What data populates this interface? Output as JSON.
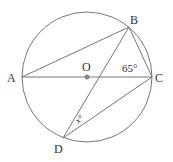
{
  "diagram": {
    "points": {
      "A": {
        "label": "A"
      },
      "B": {
        "label": "B"
      },
      "C": {
        "label": "C"
      },
      "D": {
        "label": "D"
      },
      "O": {
        "label": "O"
      }
    },
    "angles": {
      "angle_C": "65°",
      "angle_D": "x°"
    },
    "colors": {
      "line": "#777777",
      "center_dot": "#888888"
    }
  }
}
